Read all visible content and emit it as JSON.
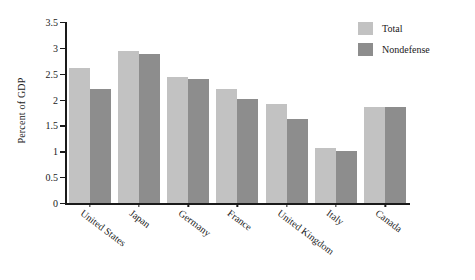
{
  "chart_data": {
    "type": "bar",
    "title": "",
    "xlabel": "",
    "ylabel": "Percent of GDP",
    "ylim": [
      0,
      3.5
    ],
    "ytick_labels": [
      "3.5",
      "3",
      "2.5",
      "2",
      "1.5",
      "1",
      "0.5",
      "0"
    ],
    "ytick_values": [
      3.5,
      3,
      2.5,
      2,
      1.5,
      1,
      0.5,
      0
    ],
    "grid": false,
    "legend_position": "top-right",
    "categories": [
      "United States",
      "Japan",
      "Germany",
      "France",
      "United Kingdom",
      "Italy",
      "Canada"
    ],
    "series": [
      {
        "name": "Total",
        "color": "#c2c2c2",
        "values": [
          2.62,
          2.94,
          2.45,
          2.22,
          1.92,
          1.08,
          1.87
        ]
      },
      {
        "name": "Nondefense",
        "color": "#8d8d8d",
        "values": [
          2.21,
          2.88,
          2.4,
          2.01,
          1.64,
          1.02,
          1.86
        ]
      }
    ]
  }
}
